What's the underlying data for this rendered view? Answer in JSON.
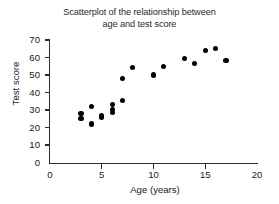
{
  "chart_data": {
    "type": "scatter",
    "title": "Scatterplot of the relationship between\nage and test score",
    "xlabel": "Age (years)",
    "ylabel": "Test score",
    "xlim": [
      0,
      20
    ],
    "ylim": [
      0,
      70
    ],
    "xticks": [
      0,
      5,
      10,
      15,
      20
    ],
    "yticks": [
      0,
      10,
      20,
      30,
      40,
      50,
      60,
      70
    ],
    "xtick_labels": [
      "0",
      "5",
      "10",
      "15",
      "20"
    ],
    "ytick_labels": [
      "0",
      "10",
      "20",
      "30",
      "40",
      "50",
      "60",
      "70"
    ],
    "grid": false,
    "legend": null,
    "marker": {
      "shape": "circle",
      "color": "#000000",
      "size": 5
    },
    "points": [
      {
        "x": 3,
        "y": 28
      },
      {
        "x": 3,
        "y": 25
      },
      {
        "x": 4,
        "y": 32
      },
      {
        "x": 4,
        "y": 22
      },
      {
        "x": 5,
        "y": 27
      },
      {
        "x": 5,
        "y": 26
      },
      {
        "x": 6,
        "y": 33
      },
      {
        "x": 6,
        "y": 30.5
      },
      {
        "x": 6,
        "y": 28.5
      },
      {
        "x": 7,
        "y": 48
      },
      {
        "x": 7,
        "y": 35.5
      },
      {
        "x": 8,
        "y": 54.5
      },
      {
        "x": 10,
        "y": 50
      },
      {
        "x": 11,
        "y": 55
      },
      {
        "x": 13,
        "y": 59.5
      },
      {
        "x": 14,
        "y": 56.5
      },
      {
        "x": 15,
        "y": 64
      },
      {
        "x": 16,
        "y": 65
      },
      {
        "x": 17,
        "y": 58.5
      }
    ]
  }
}
